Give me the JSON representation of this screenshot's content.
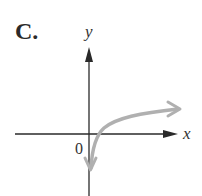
{
  "figure": {
    "label": "C.",
    "x_axis_label": "x",
    "y_axis_label": "y",
    "origin_label": "0",
    "curve_color": "#b0b0b0",
    "axis_color": "#2a2a2a"
  }
}
